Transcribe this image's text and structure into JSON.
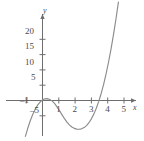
{
  "chart_data": {
    "type": "line",
    "title": "",
    "xlabel": "x",
    "ylabel": "y",
    "xlim": [
      -1.6,
      5.6
    ],
    "ylim": [
      -10,
      24
    ],
    "grid": false,
    "legend": null,
    "x_ticks": [
      -1,
      1,
      2,
      3,
      4,
      5
    ],
    "x_tick_labels": [
      "–1",
      "1",
      "2",
      "3",
      "4",
      "5"
    ],
    "y_ticks": [
      -5,
      5,
      10,
      15,
      20
    ],
    "y_tick_labels": [
      "–5",
      "5",
      "10",
      "15",
      "20"
    ],
    "curve_color": "#8c8c8c",
    "axis_color": "#6e6e6e",
    "series": [
      {
        "name": "cubic",
        "x": [
          -1.5,
          -1.35,
          -1.2,
          -1.05,
          -0.9,
          -0.75,
          -0.6,
          -0.45,
          -0.3,
          -0.15,
          0.0,
          0.15,
          0.3,
          0.45,
          0.6,
          0.75,
          0.9,
          1.05,
          1.2,
          1.35,
          1.5,
          1.65,
          1.8,
          1.95,
          2.1,
          2.25,
          2.4,
          2.55,
          2.7,
          2.85,
          3.0,
          3.15,
          3.3,
          3.45,
          3.6,
          3.75,
          3.9,
          4.05,
          4.2,
          4.35,
          4.5,
          4.65,
          4.8,
          4.95,
          5.1,
          5.25
        ],
        "y": [
          -22.0,
          -18.2,
          -14.8,
          -11.7,
          -9.0,
          -6.6,
          -4.6,
          -2.9,
          -1.5,
          -0.5,
          0.2,
          0.55,
          0.6,
          0.35,
          -0.2,
          -1.05,
          -2.15,
          -3.4,
          -4.7,
          -5.95,
          -7.05,
          -7.95,
          -8.65,
          -9.1,
          -9.35,
          -9.4,
          -9.25,
          -8.85,
          -8.2,
          -7.25,
          -6.0,
          -4.45,
          -2.55,
          -0.3,
          2.3,
          5.3,
          8.7,
          12.5,
          16.7,
          21.35,
          26.4,
          31.9,
          37.8,
          44.15,
          50.9,
          58.1
        ]
      }
    ],
    "roots": [
      -0.55,
      0.72,
      3.47
    ],
    "local_max": {
      "x": 0.25,
      "y": 0.6
    },
    "local_min": {
      "x": 2.3,
      "y": -9.4
    }
  },
  "axis_labels": {
    "x": "x",
    "y": "y"
  }
}
